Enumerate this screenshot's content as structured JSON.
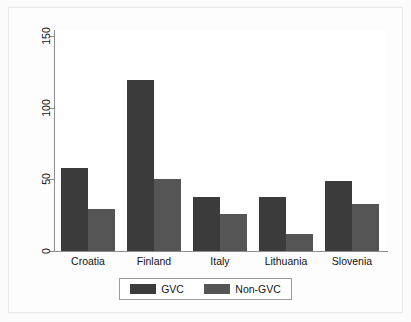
{
  "chart_data": {
    "type": "bar",
    "title": "",
    "subtitle": "",
    "xlabel": "",
    "ylabel": "",
    "categories": [
      "Croatia",
      "Finland",
      "Italy",
      "Lithuania",
      "Slovenia"
    ],
    "series": [
      {
        "name": "GVC",
        "color": "#3b3b3b",
        "values": [
          58,
          119,
          38,
          38,
          49
        ]
      },
      {
        "name": "Non-GVC",
        "color": "#555555",
        "values": [
          29,
          50,
          26,
          12,
          33
        ]
      }
    ],
    "ylim": [
      0,
      150
    ],
    "yticks": [
      0,
      50,
      100,
      150
    ],
    "ytick_labels": [
      "0",
      "50",
      "100",
      "150"
    ],
    "grid": false,
    "legend_position": "bottom",
    "legend_entries": [
      "GVC",
      "Non-GVC"
    ],
    "annotations": []
  },
  "axes": {
    "y_ticks": [
      {
        "label": "150",
        "value": 150
      },
      {
        "label": "100",
        "value": 100
      },
      {
        "label": "50",
        "value": 50
      },
      {
        "label": "0",
        "value": 0
      }
    ]
  },
  "legend": {
    "items": [
      {
        "label": "GVC",
        "color": "#3b3b3b"
      },
      {
        "label": "Non-GVC",
        "color": "#555555"
      }
    ]
  },
  "colors": {
    "gvc": "#3b3b3b",
    "non_gvc": "#555555",
    "axis": "#8d8d8d",
    "plot_background": "#ffffff",
    "figure_background": "#fbfbfb"
  }
}
